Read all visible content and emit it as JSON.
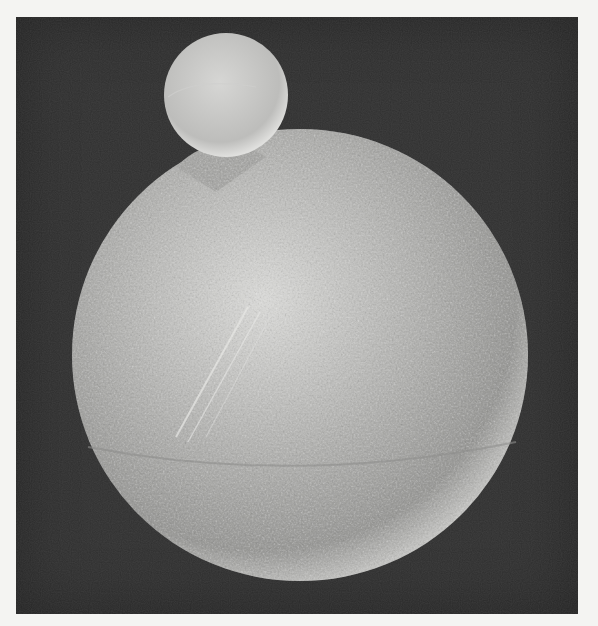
{
  "image": {
    "kind": "scanning electron micrograph (grayscale)",
    "subject": "large textured sphere with a small smooth sphere attached at upper left",
    "colors": {
      "page_margin": "#f4f4f2",
      "background": "#2e2e2e",
      "sphere_light": "#e6e6e4",
      "sphere_mid": "#b4b4b2",
      "sphere_dark": "#6e6e6c"
    }
  }
}
